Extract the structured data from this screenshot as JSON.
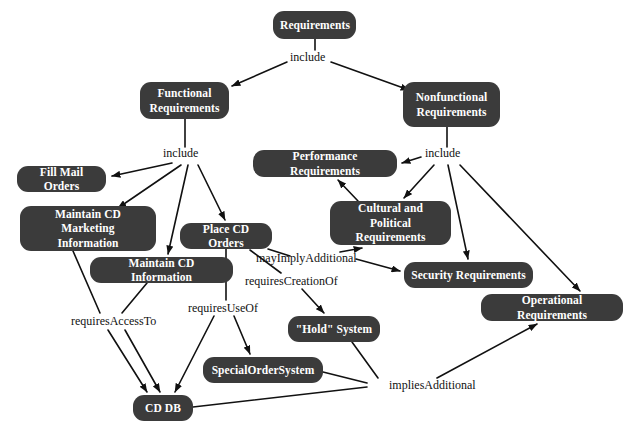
{
  "diagram": {
    "type": "concept-map",
    "canvas": {
      "width": 634,
      "height": 435
    },
    "colors": {
      "background": "#ffffff",
      "node_fill": "#3b3b3b",
      "node_text": "#ffffff",
      "edge": "#111111",
      "edge_label_text": "#111111"
    },
    "nodes": [
      {
        "id": "requirements",
        "label": "Requirements",
        "x": 273,
        "y": 11,
        "w": 83,
        "h": 28
      },
      {
        "id": "functional",
        "label": "Functional\nRequirements",
        "x": 140,
        "y": 82,
        "w": 89,
        "h": 37
      },
      {
        "id": "nonfunctional",
        "label": "Nonfunctional\nRequirements",
        "x": 403,
        "y": 82,
        "w": 97,
        "h": 45
      },
      {
        "id": "fill-mail-orders",
        "label": "Fill Mail Orders",
        "x": 17,
        "y": 166,
        "w": 89,
        "h": 26
      },
      {
        "id": "performance",
        "label": "Performance Requirements",
        "x": 253,
        "y": 150,
        "w": 144,
        "h": 27
      },
      {
        "id": "maintain-cd-marketing-information",
        "label": "Maintain CD Marketing\nInformation",
        "x": 20,
        "y": 206,
        "w": 136,
        "h": 45
      },
      {
        "id": "cultural-political",
        "label": "Cultural and Political\nRequirements",
        "x": 330,
        "y": 201,
        "w": 121,
        "h": 44
      },
      {
        "id": "place-cd-orders",
        "label": "Place CD Orders",
        "x": 180,
        "y": 223,
        "w": 92,
        "h": 26
      },
      {
        "id": "maintain-cd-information",
        "label": "Maintain CD Information",
        "x": 90,
        "y": 257,
        "w": 143,
        "h": 26
      },
      {
        "id": "security",
        "label": "Security Requirements",
        "x": 404,
        "y": 262,
        "w": 129,
        "h": 26
      },
      {
        "id": "operational",
        "label": "Operational Requirements",
        "x": 481,
        "y": 294,
        "w": 142,
        "h": 27
      },
      {
        "id": "hold-system",
        "label": "\"Hold\" System",
        "x": 288,
        "y": 316,
        "w": 92,
        "h": 26
      },
      {
        "id": "special-order-system",
        "label": "SpecialOrderSystem",
        "x": 203,
        "y": 357,
        "w": 120,
        "h": 26
      },
      {
        "id": "cd-db",
        "label": "CD DB",
        "x": 133,
        "y": 395,
        "w": 60,
        "h": 26
      }
    ],
    "edge_labels": [
      {
        "id": "include-top",
        "label": "include",
        "x": 290,
        "y": 56
      },
      {
        "id": "include-functional",
        "label": "include",
        "x": 163,
        "y": 152
      },
      {
        "id": "include-nonfunctional",
        "label": "include",
        "x": 425,
        "y": 152
      },
      {
        "id": "may-imply-additional",
        "label": "mayImplyAdditional",
        "x": 256,
        "y": 254
      },
      {
        "id": "requires-creation-of",
        "label": "requiresCreationOf",
        "x": 245,
        "y": 281
      },
      {
        "id": "requires-use-of",
        "label": "requiresUseOf",
        "x": 188,
        "y": 307
      },
      {
        "id": "requires-access-to",
        "label": "requiresAccessTo",
        "x": 71,
        "y": 320
      },
      {
        "id": "implies-additional",
        "label": "impliesAdditional",
        "x": 389,
        "y": 384
      }
    ],
    "edges": [
      {
        "from": "requirements",
        "to": "include-top",
        "label": "",
        "arrow": false
      },
      {
        "from": "include-top",
        "to": "functional",
        "label": "include",
        "arrow": true
      },
      {
        "from": "include-top",
        "to": "nonfunctional",
        "label": "include",
        "arrow": true
      },
      {
        "from": "functional",
        "to": "include-functional",
        "label": "",
        "arrow": false
      },
      {
        "from": "include-functional",
        "to": "fill-mail-orders",
        "label": "include",
        "arrow": true
      },
      {
        "from": "include-functional",
        "to": "maintain-cd-marketing-information",
        "label": "include",
        "arrow": true
      },
      {
        "from": "include-functional",
        "to": "maintain-cd-information",
        "label": "include",
        "arrow": true
      },
      {
        "from": "include-functional",
        "to": "place-cd-orders",
        "label": "include",
        "arrow": true
      },
      {
        "from": "nonfunctional",
        "to": "include-nonfunctional",
        "label": "",
        "arrow": false
      },
      {
        "from": "include-nonfunctional",
        "to": "performance",
        "label": "include",
        "arrow": true
      },
      {
        "from": "include-nonfunctional",
        "to": "cultural-political",
        "label": "include",
        "arrow": true
      },
      {
        "from": "include-nonfunctional",
        "to": "security",
        "label": "include",
        "arrow": true
      },
      {
        "from": "include-nonfunctional",
        "to": "operational",
        "label": "include",
        "arrow": true
      },
      {
        "from": "place-cd-orders",
        "to": "may-imply-additional",
        "label": "mayImplyAdditional",
        "arrow": false
      },
      {
        "from": "may-imply-additional",
        "to": "security",
        "label": "mayImplyAdditional",
        "arrow": true
      },
      {
        "from": "may-imply-additional",
        "to": "cultural-political",
        "label": "mayImplyAdditional",
        "arrow": true
      },
      {
        "from": "place-cd-orders",
        "to": "requires-creation-of",
        "label": "requiresCreationOf",
        "arrow": false
      },
      {
        "from": "requires-creation-of",
        "to": "hold-system",
        "label": "requiresCreationOf",
        "arrow": true
      },
      {
        "from": "place-cd-orders",
        "to": "requires-use-of",
        "label": "requiresUseOf",
        "arrow": false
      },
      {
        "from": "requires-use-of",
        "to": "cd-db",
        "label": "requiresUseOf",
        "arrow": true
      },
      {
        "from": "requires-use-of",
        "to": "special-order-system",
        "label": "requiresUseOf",
        "arrow": true
      },
      {
        "from": "maintain-cd-marketing-information",
        "to": "requires-access-to",
        "label": "requiresAccessTo",
        "arrow": false
      },
      {
        "from": "maintain-cd-information",
        "to": "requires-access-to",
        "label": "requiresAccessTo",
        "arrow": false
      },
      {
        "from": "requires-access-to",
        "to": "cd-db",
        "label": "requiresAccessTo",
        "arrow": true
      },
      {
        "from": "cd-db",
        "to": "implies-additional",
        "label": "impliesAdditional",
        "arrow": false
      },
      {
        "from": "special-order-system",
        "to": "implies-additional",
        "label": "impliesAdditional",
        "arrow": false
      },
      {
        "from": "hold-system",
        "to": "implies-additional",
        "label": "impliesAdditional",
        "arrow": false
      },
      {
        "from": "implies-additional",
        "to": "operational",
        "label": "impliesAdditional",
        "arrow": true
      },
      {
        "from": "performance",
        "to": "cultural-political",
        "label": "",
        "arrow": true
      }
    ]
  }
}
